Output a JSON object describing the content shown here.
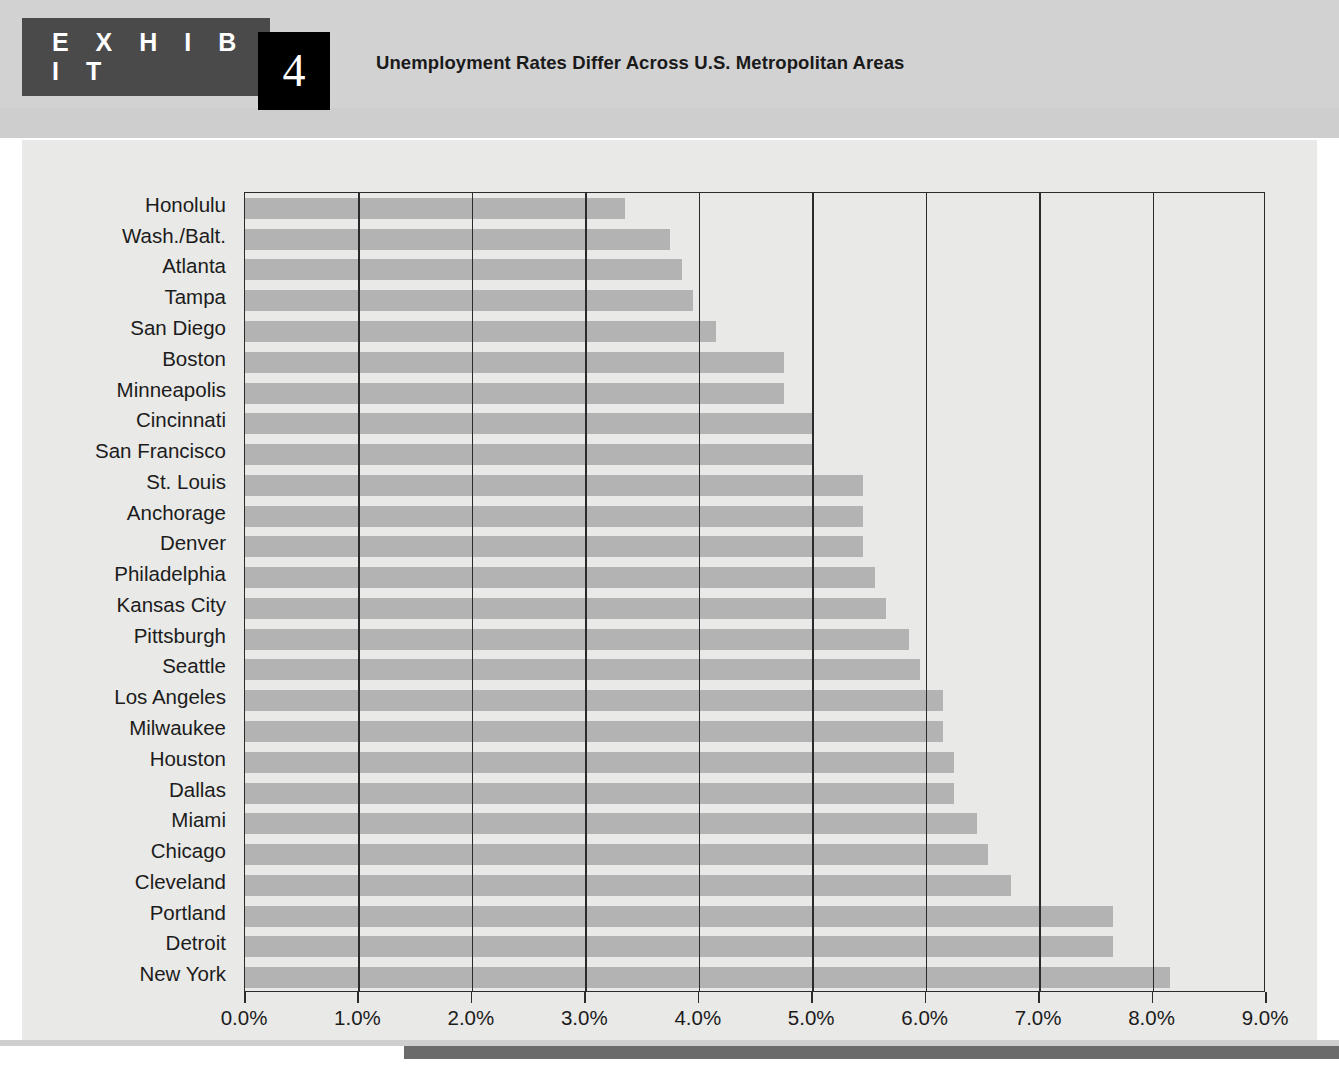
{
  "header": {
    "exhibit_label": "E X H I B I T",
    "exhibit_number": "4",
    "title": "Unemployment Rates Differ Across U.S. Metropolitan Areas"
  },
  "colors": {
    "banner": "#4a4a4a",
    "number_box": "#000000",
    "bar": "#b3b3b3",
    "plate": "#e9e9e7",
    "axis": "#2b2b2b",
    "accent": "#6b6b6b"
  },
  "chart_data": {
    "type": "bar",
    "orientation": "horizontal",
    "title": "Unemployment Rates Differ Across U.S. Metropolitan Areas",
    "xlabel": "",
    "ylabel": "",
    "xlim": [
      0.0,
      9.0
    ],
    "xticks": [
      0.0,
      1.0,
      2.0,
      3.0,
      4.0,
      5.0,
      6.0,
      7.0,
      8.0,
      9.0
    ],
    "xtick_labels": [
      "0.0%",
      "1.0%",
      "2.0%",
      "3.0%",
      "4.0%",
      "5.0%",
      "6.0%",
      "7.0%",
      "8.0%",
      "9.0%"
    ],
    "grid": true,
    "legend": null,
    "categories": [
      "Honolulu",
      "Wash./Balt.",
      "Atlanta",
      "Tampa",
      "San Diego",
      "Boston",
      "Minneapolis",
      "Cincinnati",
      "San Francisco",
      "St. Louis",
      "Anchorage",
      "Denver",
      "Philadelphia",
      "Kansas City",
      "Pittsburgh",
      "Seattle",
      "Los Angeles",
      "Milwaukee",
      "Houston",
      "Dallas",
      "Miami",
      "Chicago",
      "Cleveland",
      "Portland",
      "Detroit",
      "New York"
    ],
    "values": [
      3.35,
      3.75,
      3.85,
      3.95,
      4.15,
      4.75,
      4.75,
      5.0,
      5.0,
      5.45,
      5.45,
      5.45,
      5.55,
      5.65,
      5.85,
      5.95,
      6.15,
      6.15,
      6.25,
      6.25,
      6.45,
      6.55,
      6.75,
      7.65,
      7.65,
      8.15
    ],
    "value_unit": "%"
  }
}
